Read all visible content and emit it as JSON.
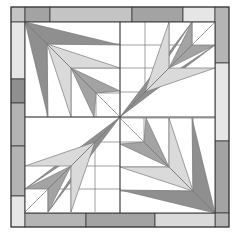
{
  "diagram": {
    "type": "quilt-block",
    "colors": {
      "background": "#ffffff",
      "line": "#3a3a3a",
      "thin_line": "#7a7a7a",
      "dark": "#8f8f8f",
      "medium_dark": "#a3a3a3",
      "medium": "#b4b4b4",
      "light_medium": "#c4c4c4",
      "light": "#dadada",
      "very_light": "#e6e6e6"
    },
    "outer": {
      "x": 11,
      "y": 7,
      "w": 218,
      "h": 220
    },
    "inner": {
      "x": 25,
      "y": 22,
      "w": 190,
      "h": 191
    },
    "center": {
      "x": 120,
      "y": 117
    },
    "border": {
      "top": [
        {
          "x": 11,
          "w": 14,
          "fill": "light_medium"
        },
        {
          "x": 25,
          "w": 25,
          "fill": "medium_dark"
        },
        {
          "x": 50,
          "w": 82,
          "fill": "light_medium"
        },
        {
          "x": 132,
          "w": 51,
          "fill": "medium_dark"
        },
        {
          "x": 183,
          "w": 32,
          "fill": "very_light"
        }
      ],
      "left": [
        {
          "y": 22,
          "h": 57,
          "fill": "very_light"
        },
        {
          "y": 79,
          "h": 24,
          "fill": "dark"
        },
        {
          "y": 103,
          "h": 43,
          "fill": "medium"
        },
        {
          "y": 146,
          "h": 50,
          "fill": "medium"
        },
        {
          "y": 196,
          "h": 31,
          "fill": "very_light"
        }
      ],
      "right": [
        {
          "y": 7,
          "h": 56,
          "fill": "medium"
        },
        {
          "y": 63,
          "h": 78,
          "fill": "very_light"
        },
        {
          "y": 141,
          "h": 72,
          "fill": "medium_dark"
        },
        {
          "y": 213,
          "h": 14,
          "fill": "medium"
        }
      ],
      "bottom": [
        {
          "x": 25,
          "w": 61,
          "fill": "medium"
        },
        {
          "x": 86,
          "w": 69,
          "fill": "medium_dark"
        },
        {
          "x": 155,
          "w": 60,
          "fill": "light"
        }
      ]
    }
  }
}
